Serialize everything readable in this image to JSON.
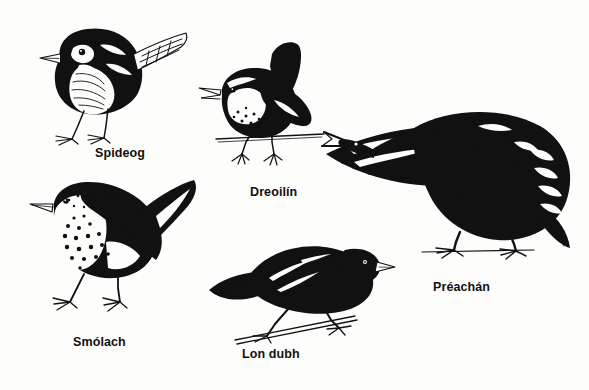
{
  "plate": {
    "title": "Irish bird names illustration plate",
    "background_color": "#fdfdfc",
    "ink_color": "#111111",
    "style": "pen-and-ink line drawing"
  },
  "birds": [
    {
      "id": "spideog",
      "label": "Spideog",
      "english": "Robin",
      "icon": "robin-bird-icon",
      "pose": "perched on ground, facing left, tail raised"
    },
    {
      "id": "dreoilin",
      "label": "Dreoilín",
      "english": "Wren",
      "icon": "wren-bird-icon",
      "pose": "perched on twig, singing with open beak, tail cocked upright"
    },
    {
      "id": "smolach",
      "label": "Smólach",
      "english": "Song thrush",
      "icon": "thrush-bird-icon",
      "pose": "standing, facing left, spotted breast"
    },
    {
      "id": "londubh",
      "label": "Lon dubh",
      "english": "Blackbird",
      "icon": "blackbird-bird-icon",
      "pose": "perched on thin branch, facing right, body horizontal"
    },
    {
      "id": "preachan",
      "label": "Préachán",
      "english": "Crow",
      "icon": "crow-bird-icon",
      "pose": "standing on ground, head lowered to the left, beak open"
    }
  ]
}
